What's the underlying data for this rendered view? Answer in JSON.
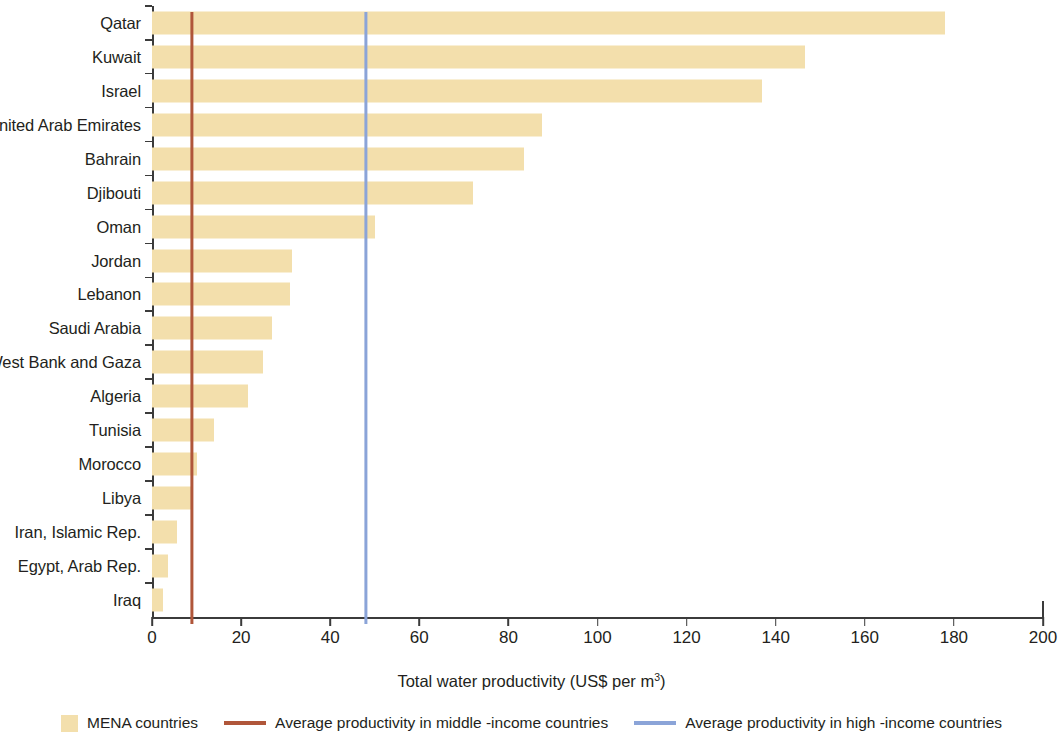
{
  "chart_data": {
    "type": "bar",
    "orientation": "horizontal",
    "title": "",
    "xlabel": "Total water productivity (US$ per m3)",
    "ylabel": "",
    "xlim": [
      0,
      200
    ],
    "xticks": [
      0,
      20,
      40,
      60,
      80,
      100,
      120,
      140,
      160,
      180,
      200
    ],
    "grid": false,
    "legend_position": "bottom",
    "categories": [
      "Qatar",
      "Kuwait",
      "Israel",
      "United Arab Emirates",
      "Bahrain",
      "Djibouti",
      "Oman",
      "Jordan",
      "Lebanon",
      "Saudi Arabia",
      "West Bank and Gaza",
      "Algeria",
      "Tunisia",
      "Morocco",
      "Libya",
      "Iran, Islamic Rep.",
      "Egypt, Arab Rep.",
      "Iraq"
    ],
    "values": [
      178,
      146.5,
      137,
      87.5,
      83.5,
      72,
      50,
      31.5,
      31,
      27,
      25,
      21.5,
      14,
      10,
      9,
      5.5,
      3.5,
      2.5
    ],
    "series": [
      {
        "name": "MENA countries",
        "color": "#f3dfac",
        "values": [
          178,
          146.5,
          137,
          87.5,
          83.5,
          72,
          50,
          31.5,
          31,
          27,
          25,
          21.5,
          14,
          10,
          9,
          5.5,
          3.5,
          2.5
        ]
      }
    ],
    "reference_lines": [
      {
        "name": "Average productivity in middle -income countries",
        "value": 9,
        "color": "#b0563a"
      },
      {
        "name": "Average productivity in high -income countries",
        "value": 48,
        "color": "#8ba4d8"
      }
    ]
  },
  "axis": {
    "x_title_main": "Total water productivity (US$ per m",
    "x_title_sup": "3",
    "x_title_close": ")",
    "ticks": [
      {
        "label": "0",
        "value": 0
      },
      {
        "label": "20",
        "value": 20
      },
      {
        "label": "40",
        "value": 40
      },
      {
        "label": "60",
        "value": 60
      },
      {
        "label": "80",
        "value": 80
      },
      {
        "label": "100",
        "value": 100
      },
      {
        "label": "120",
        "value": 120
      },
      {
        "label": "140",
        "value": 140
      },
      {
        "label": "160",
        "value": 160
      },
      {
        "label": "180",
        "value": 180
      },
      {
        "label": "200",
        "value": 200
      }
    ]
  },
  "legend": {
    "items": [
      {
        "label": "MENA countries",
        "marker": "box",
        "color": "#f3dfac"
      },
      {
        "label": "Average productivity in middle -income countries",
        "marker": "line",
        "color": "#b0563a"
      },
      {
        "label": "Average productivity in high -income countries",
        "marker": "line",
        "color": "#8ba4d8"
      }
    ]
  },
  "colors": {
    "bar": "#f3dfac",
    "middle_income_line": "#b0563a",
    "high_income_line": "#8ba4d8",
    "axis": "#3b3b3b",
    "text": "#231f20"
  }
}
